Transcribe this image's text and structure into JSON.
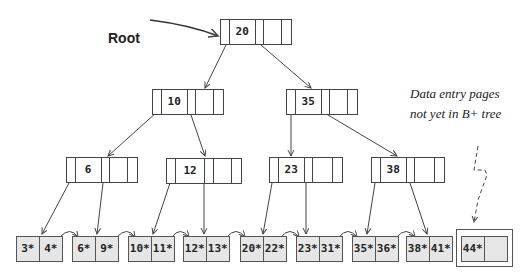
{
  "diagram": {
    "root_label": "Root",
    "annotation": {
      "line1": "Data entry pages",
      "line2": "not yet in B+ tree"
    },
    "levels": {
      "root": [
        {
          "key": "20"
        }
      ],
      "level1": [
        {
          "key": "10"
        },
        {
          "key": "35"
        }
      ],
      "level2": [
        {
          "key": "6"
        },
        {
          "key": "12"
        },
        {
          "key": "23"
        },
        {
          "key": "38"
        }
      ]
    },
    "leaves": [
      {
        "entries": [
          "3*",
          "4*"
        ]
      },
      {
        "entries": [
          "6*",
          "9*"
        ]
      },
      {
        "entries": [
          "10*",
          "11*"
        ]
      },
      {
        "entries": [
          "12*",
          "13*"
        ]
      },
      {
        "entries": [
          "20*",
          "22*"
        ]
      },
      {
        "entries": [
          "23*",
          "31*"
        ]
      },
      {
        "entries": [
          "35*",
          "36*"
        ]
      },
      {
        "entries": [
          "38*",
          "41*"
        ]
      }
    ],
    "pending_leaf": {
      "entries": [
        "44*",
        ""
      ]
    },
    "colors": {
      "line": "#444444",
      "leaf_fill": "#e6e6e6"
    }
  }
}
